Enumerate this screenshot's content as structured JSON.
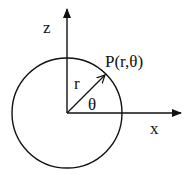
{
  "diagram": {
    "title": "",
    "labels": {
      "z_axis": "z",
      "x_axis": "x",
      "point": "P(r,θ)",
      "radius": "r",
      "angle": "θ"
    },
    "geometry": {
      "origin": [
        67,
        113
      ],
      "circle_radius": 55,
      "z_axis_tip": [
        67,
        8
      ],
      "x_axis_tip": [
        182,
        113
      ],
      "point_P": [
        106,
        74
      ]
    },
    "colors": {
      "stroke": "#111111",
      "background": "#ffffff"
    }
  }
}
